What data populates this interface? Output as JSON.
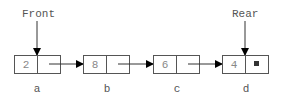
{
  "diagram": {
    "type": "linked-list-queue",
    "pointers": {
      "front": {
        "label": "Front",
        "target": "a"
      },
      "rear": {
        "label": "Rear",
        "target": "d"
      }
    },
    "nodes": [
      {
        "id": "a",
        "label": "a",
        "value": "2",
        "next": "b"
      },
      {
        "id": "b",
        "label": "b",
        "value": "8",
        "next": "c"
      },
      {
        "id": "c",
        "label": "c",
        "value": "6",
        "next": "d"
      },
      {
        "id": "d",
        "label": "d",
        "value": "4",
        "next": null,
        "null_marker": "■"
      }
    ]
  }
}
